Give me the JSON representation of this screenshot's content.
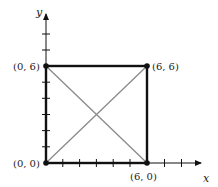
{
  "diagram": {
    "type": "coordinate-square",
    "axes": {
      "x_label": "x",
      "y_label": "y"
    },
    "points": [
      {
        "label": "(0, 0)",
        "x": 0,
        "y": 0
      },
      {
        "label": "(0, 6)",
        "x": 0,
        "y": 6
      },
      {
        "label": "(6, 6)",
        "x": 6,
        "y": 6
      },
      {
        "label": "(6, 0)",
        "x": 6,
        "y": 0
      }
    ],
    "square_sides": "black",
    "diagonals": "gray",
    "colors": {
      "square": "#111111",
      "diagonal": "#8a8a8a",
      "axis": "#111111"
    }
  }
}
